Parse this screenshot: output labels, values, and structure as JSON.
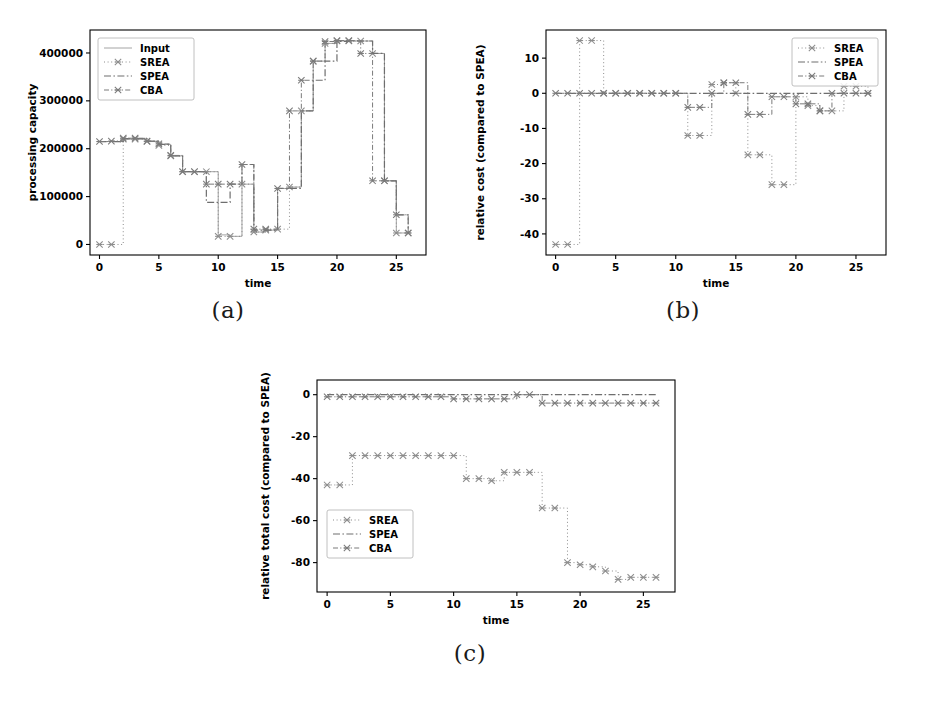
{
  "figure": {
    "background": "#ffffff",
    "panels": [
      {
        "id": "a",
        "caption": "(a)"
      },
      {
        "id": "b",
        "caption": "(b)"
      },
      {
        "id": "c",
        "caption": "(c)"
      }
    ]
  },
  "chart_data": [
    {
      "id": "a",
      "type": "line",
      "title": "",
      "xlabel": "time",
      "ylabel": "processing capacity",
      "xlim": [
        -0.8,
        27.5
      ],
      "ylim": [
        -22000,
        448000
      ],
      "xticks": [
        0,
        5,
        10,
        15,
        20,
        25
      ],
      "xticklabels": [
        "0",
        "5",
        "10",
        "15",
        "20",
        "25"
      ],
      "yticks": [
        0,
        100000,
        200000,
        300000,
        400000
      ],
      "yticklabels": [
        "0",
        "100000",
        "200000",
        "300000",
        "400000"
      ],
      "grid": false,
      "legend_position": "upper left",
      "legend": [
        "Input",
        "SREA",
        "SPEA",
        "CBA"
      ],
      "x": [
        0,
        1,
        2,
        3,
        4,
        5,
        6,
        7,
        8,
        9,
        10,
        11,
        12,
        13,
        14,
        15,
        16,
        17,
        18,
        19,
        20,
        21,
        22,
        23,
        24,
        25,
        26
      ],
      "series": [
        {
          "name": "Input",
          "style": "solid",
          "marker": "none",
          "color": "#9a9a9a",
          "values": [
            215000,
            215000,
            220000,
            220000,
            215000,
            209000,
            185000,
            152000,
            152000,
            152000,
            20000,
            17000,
            126000,
            26000,
            30000,
            117000,
            120000,
            279000,
            383000,
            420000,
            425000,
            425000,
            425000,
            399000,
            133000,
            24000,
            24000
          ]
        },
        {
          "name": "SREA",
          "style": "dotted",
          "marker": "x",
          "color": "#8c8c8c",
          "values": [
            0,
            0,
            220000,
            220000,
            215000,
            207000,
            185000,
            152000,
            152000,
            152000,
            17000,
            17000,
            126000,
            26000,
            30000,
            32000,
            120000,
            279000,
            383000,
            420000,
            425000,
            425000,
            425000,
            399000,
            133000,
            24000,
            24000
          ]
        },
        {
          "name": "SPEA",
          "style": "dashdot",
          "marker": "none",
          "color": "#6e6e6e",
          "values": [
            215000,
            215000,
            221000,
            221000,
            216000,
            209000,
            185000,
            152000,
            152000,
            88000,
            88000,
            126000,
            167000,
            30000,
            30000,
            117000,
            117000,
            279000,
            343000,
            383000,
            424000,
            425000,
            425000,
            399000,
            133000,
            62000,
            24000
          ]
        },
        {
          "name": "CBA",
          "style": "dashdot-fine",
          "marker": "x",
          "color": "#7a7a7a",
          "values": [
            215000,
            216000,
            222000,
            222000,
            216000,
            210000,
            186000,
            152000,
            152000,
            126000,
            126000,
            126000,
            167000,
            32000,
            32000,
            117000,
            279000,
            343000,
            383000,
            424000,
            426000,
            426000,
            399000,
            133000,
            133000,
            62000,
            24000
          ]
        }
      ]
    },
    {
      "id": "b",
      "type": "line",
      "title": "",
      "xlabel": "time",
      "ylabel": "relative cost (compared to SPEA)",
      "xlim": [
        -0.8,
        27.5
      ],
      "ylim": [
        -46,
        18
      ],
      "xticks": [
        0,
        5,
        10,
        15,
        20,
        25
      ],
      "xticklabels": [
        "0",
        "5",
        "10",
        "15",
        "20",
        "25"
      ],
      "yticks": [
        10,
        0,
        -10,
        -20,
        -30,
        -40
      ],
      "yticklabels": [
        "10",
        "0",
        "-10",
        "-20",
        "-30",
        "-40"
      ],
      "grid": false,
      "legend_position": "upper right",
      "legend": [
        "SREA",
        "SPEA",
        "CBA"
      ],
      "x": [
        0,
        1,
        2,
        3,
        4,
        5,
        6,
        7,
        8,
        9,
        10,
        11,
        12,
        13,
        14,
        15,
        16,
        17,
        18,
        19,
        20,
        21,
        22,
        23,
        24,
        25,
        26
      ],
      "series": [
        {
          "name": "SREA",
          "style": "dotted",
          "marker": "x",
          "color": "#8c8c8c",
          "values": [
            -43,
            -43,
            15,
            15,
            0,
            0,
            0,
            0,
            0,
            0,
            0,
            -12,
            -12,
            2.5,
            3,
            0,
            -17.5,
            -17.5,
            -26,
            -26,
            -1,
            -3.5,
            -5,
            -5,
            2,
            2,
            0
          ]
        },
        {
          "name": "SPEA",
          "style": "dashdot",
          "marker": "none",
          "color": "#6e6e6e",
          "values": [
            0,
            0,
            0,
            0,
            0,
            0,
            0,
            0,
            0,
            0,
            0,
            0,
            0,
            0,
            0,
            0,
            0,
            0,
            0,
            0,
            0,
            0,
            0,
            0,
            0,
            0,
            0
          ]
        },
        {
          "name": "CBA",
          "style": "dashdot-fine",
          "marker": "x",
          "color": "#7a7a7a",
          "values": [
            0,
            0,
            0,
            0,
            0,
            0,
            0,
            0,
            0,
            0,
            0,
            -4,
            -4,
            0,
            3,
            3,
            -6,
            -6,
            -1,
            -1,
            -3,
            -3,
            -5,
            0,
            0,
            0,
            0
          ]
        }
      ]
    },
    {
      "id": "c",
      "type": "line",
      "title": "",
      "xlabel": "time",
      "ylabel": "relative total cost (compared to SPEA)",
      "xlim": [
        -0.8,
        27.5
      ],
      "ylim": [
        -94,
        7
      ],
      "xticks": [
        0,
        5,
        10,
        15,
        20,
        25
      ],
      "xticklabels": [
        "0",
        "5",
        "10",
        "15",
        "20",
        "25"
      ],
      "yticks": [
        0,
        -20,
        -40,
        -60,
        -80
      ],
      "yticklabels": [
        "0",
        "-20",
        "-40",
        "-60",
        "-80"
      ],
      "grid": false,
      "legend_position": "lower left",
      "legend": [
        "SREA",
        "SPEA",
        "CBA"
      ],
      "x": [
        0,
        1,
        2,
        3,
        4,
        5,
        6,
        7,
        8,
        9,
        10,
        11,
        12,
        13,
        14,
        15,
        16,
        17,
        18,
        19,
        20,
        21,
        22,
        23,
        24,
        25,
        26
      ],
      "series": [
        {
          "name": "SREA",
          "style": "dotted",
          "marker": "x",
          "color": "#8c8c8c",
          "values": [
            -43,
            -43,
            -29,
            -29,
            -29,
            -29,
            -29,
            -29,
            -29,
            -29,
            -29,
            -40,
            -40,
            -41,
            -37,
            -37,
            -37,
            -54,
            -54,
            -80,
            -81,
            -82,
            -84,
            -88,
            -87,
            -87,
            -87
          ]
        },
        {
          "name": "SPEA",
          "style": "dashdot",
          "marker": "none",
          "color": "#6e6e6e",
          "values": [
            0,
            0,
            0,
            0,
            0,
            0,
            0,
            0,
            0,
            0,
            0,
            0,
            0,
            0,
            0,
            0,
            0,
            0,
            0,
            0,
            0,
            0,
            0,
            0,
            0,
            0,
            0
          ]
        },
        {
          "name": "CBA",
          "style": "dashdot-fine",
          "marker": "x",
          "color": "#7a7a7a",
          "values": [
            -1,
            -1,
            -1,
            -1,
            -1,
            -1,
            -1,
            -1,
            -1,
            -1,
            -2,
            -2,
            -2,
            -2,
            -2,
            0,
            0,
            -4,
            -4,
            -4,
            -4,
            -4,
            -4,
            -4,
            -4,
            -4,
            -4
          ]
        }
      ]
    }
  ]
}
